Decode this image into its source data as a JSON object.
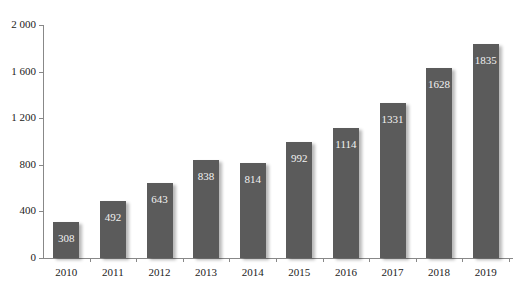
{
  "chart_data": {
    "type": "bar",
    "title": "",
    "xlabel": "",
    "ylabel": "",
    "categories": [
      "2010",
      "2011",
      "2012",
      "2013",
      "2014",
      "2015",
      "2016",
      "2017",
      "2018",
      "2019"
    ],
    "values": [
      308,
      492,
      643,
      838,
      814,
      992,
      1114,
      1331,
      1628,
      1835
    ],
    "data_labels": [
      "308",
      "492",
      "643",
      "838",
      "814",
      "992",
      "1114",
      "1331",
      "1628",
      "1835"
    ],
    "yticks": [
      0,
      400,
      800,
      1200,
      1600,
      2000
    ],
    "ytick_labels": [
      "0",
      "400",
      "800",
      "1 200",
      "1 600",
      "2 000"
    ],
    "ylim": [
      0,
      2000
    ],
    "grid": false,
    "legend": null,
    "bar_color": "#5b5b5b",
    "label_color": "#f2f2f2"
  }
}
